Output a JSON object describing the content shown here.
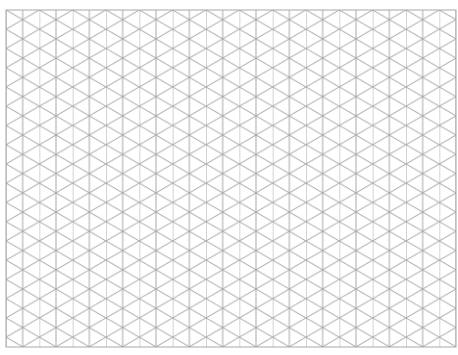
{
  "sheet": {
    "type": "isometric-grid-paper",
    "background": "#ffffff",
    "line_color": "#a8a8a8",
    "origin_x": 6,
    "origin_y": 10,
    "width": 450,
    "height": 337,
    "column_spacing": 16.67,
    "columns": 27
  }
}
